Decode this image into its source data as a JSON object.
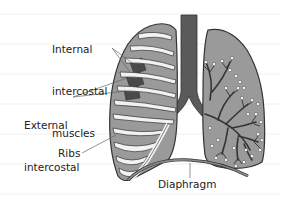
{
  "diagram": {
    "labels": {
      "internal": [
        "Internal",
        "intercostal",
        "muscles"
      ],
      "external": [
        "External",
        "intercostal",
        "muscles"
      ],
      "ribs": "Ribs",
      "diaphragm": "Diaphragm"
    },
    "colors": {
      "lung_fill": "#9a9a9a",
      "trachea": "#5a5a5a",
      "bronchi": "#333333",
      "rib": "#f2f2f2",
      "muscle_dark": "#4a4a4a",
      "outline": "#333333",
      "alveoli": "#ffffff"
    }
  }
}
